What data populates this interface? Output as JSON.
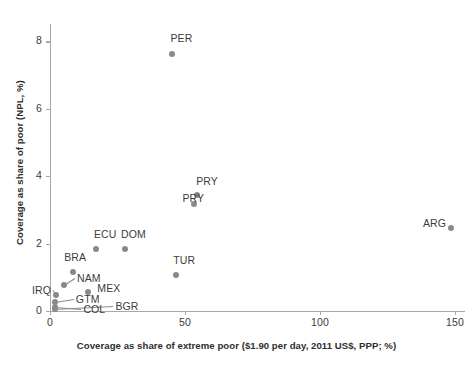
{
  "chart_data": {
    "type": "scatter",
    "title": "",
    "xlabel": "Coverage as share of extreme poor ($1.90 per day, 2011 US$, PPP; %)",
    "ylabel": "Coverage as share of poor (NPL, %)",
    "xlim": [
      0,
      162
    ],
    "ylim": [
      0,
      8.4
    ],
    "xticks": [
      "0",
      "50",
      "100",
      "150"
    ],
    "xtick_values": [
      0,
      50,
      100,
      150
    ],
    "yticks": [
      "0",
      "2",
      "4",
      "6",
      "8"
    ],
    "ytick_values": [
      0,
      2,
      4,
      6,
      8
    ],
    "grid": false,
    "legend": null,
    "marker_color": "#8a8a8a",
    "axis_color": "#a8a8a8",
    "text_color": "#3c3c3c",
    "points": [
      {
        "label": "PER",
        "x": 45.0,
        "y": 7.62,
        "label_dx": -1,
        "label_dy": -15,
        "leader": false
      },
      {
        "label": "PRY",
        "x": 54.5,
        "y": 3.45,
        "label_dx": -1,
        "label_dy": -13,
        "leader": false
      },
      {
        "label": "PRY",
        "x": 53.5,
        "y": 3.18,
        "label_dx": -12,
        "label_dy": -5,
        "leader": false
      },
      {
        "label": "ARG",
        "x": 148.5,
        "y": 2.47,
        "label_dx": -28,
        "label_dy": -4,
        "leader": false
      },
      {
        "label": "ECU",
        "x": 17.0,
        "y": 1.84,
        "label_dx": -2,
        "label_dy": -14,
        "leader": false
      },
      {
        "label": "DOM",
        "x": 27.8,
        "y": 1.84,
        "label_dx": -4,
        "label_dy": -14,
        "leader": false
      },
      {
        "label": "TUR",
        "x": 46.8,
        "y": 1.07,
        "label_dx": -3,
        "label_dy": -14,
        "leader": false
      },
      {
        "label": "BRA",
        "x": 8.6,
        "y": 1.16,
        "label_dx": -9,
        "label_dy": -14,
        "leader": false
      },
      {
        "label": "NAM",
        "x": 5.2,
        "y": 0.78,
        "label_dx": 13,
        "label_dy": -6,
        "leader": true
      },
      {
        "label": "MEX",
        "x": 14.2,
        "y": 0.57,
        "label_dx": 9,
        "label_dy": -3,
        "leader": false
      },
      {
        "label": "IRQ",
        "x": 2.2,
        "y": 0.46,
        "label_dx": -24,
        "label_dy": -4,
        "leader": true
      },
      {
        "label": "GTM",
        "x": 1.8,
        "y": 0.27,
        "label_dx": 21,
        "label_dy": -2,
        "leader": true
      },
      {
        "label": "COL",
        "x": 2.0,
        "y": 0.12,
        "label_dx": 28,
        "label_dy": 3,
        "leader": true
      },
      {
        "label": "BGR",
        "x": 2.0,
        "y": 0.06,
        "label_dx": 60,
        "label_dy": -2,
        "leader": true
      }
    ]
  }
}
